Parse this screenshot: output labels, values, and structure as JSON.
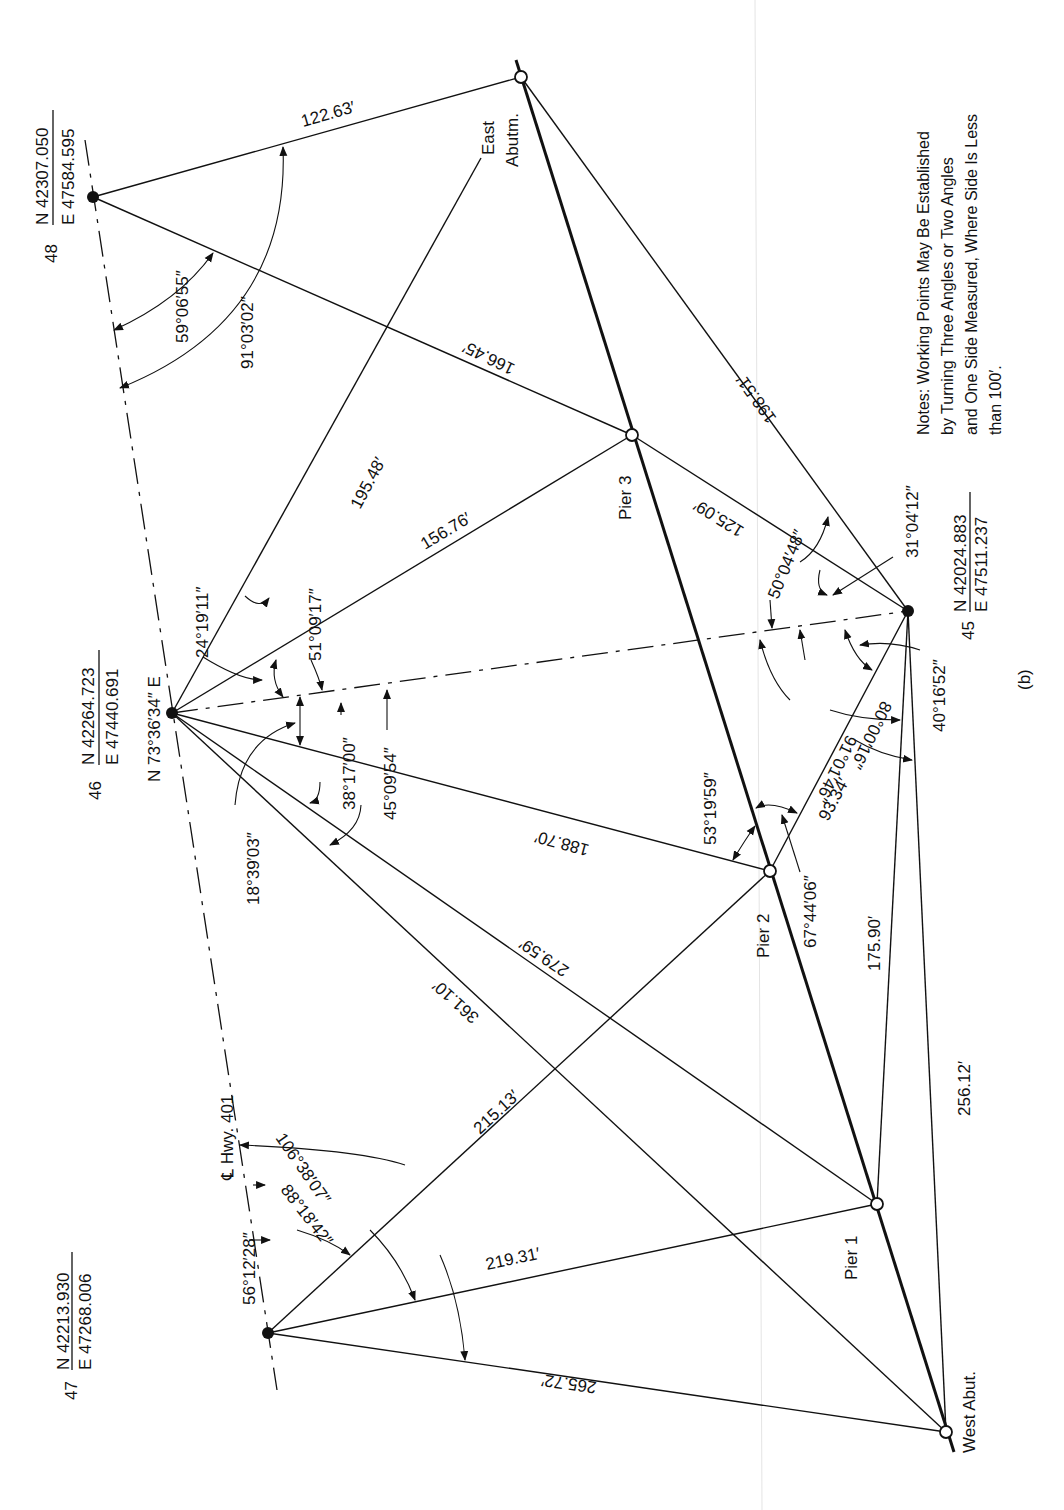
{
  "figure": {
    "label": "(b)",
    "note_lines": [
      "Notes:  Working Points May Be Established",
      "by Turning Three Angles or Two Angles",
      "and One Side Measured, Where Side Is Less",
      "than 100′."
    ]
  },
  "highway": {
    "label": "℄ Hwy. 401",
    "bearing": "N 73°36′34″ E"
  },
  "stations": [
    {
      "id": "48",
      "northing": "N 42307.050",
      "easting": "E 47584.595"
    },
    {
      "id": "46",
      "northing": "N 42264.723",
      "easting": "E 47440.691"
    },
    {
      "id": "47",
      "northing": "N 42213.930",
      "easting": "E 47268.006"
    },
    {
      "id": "45",
      "northing": "N 42024.883",
      "easting": "E 47511.237"
    }
  ],
  "working_points": [
    {
      "name": "East Abutm.",
      "line1": "East",
      "line2": "Abutm."
    },
    {
      "name": "Pier 3"
    },
    {
      "name": "Pier 2"
    },
    {
      "name": "Pier 1"
    },
    {
      "name": "West Abut."
    }
  ],
  "distances": {
    "s48_east_abut": "122.63′",
    "s48_pier3": "166.45′",
    "s46_east_abut": "195.48′",
    "s46_pier3": "156.76′",
    "s46_pier2": "188.70′",
    "s46_pier1": "279.59′",
    "s46_west_abut": "361.10′",
    "s47_pier2": "215.13′",
    "s47_pier1": "219.31′",
    "s47_west_abut": "265.72′",
    "s45_east_abut": "198.51′",
    "s45_pier3": "125.09′",
    "s45_pier2": "93.34′",
    "s45_pier1": "175.90′",
    "s45_west_abut": "256.12′"
  },
  "angles": {
    "s48_a1": "59°06′55″",
    "s48_a2": "91°03′02″",
    "s46_a1": "24°19′11″",
    "s46_a2": "51°09′17″",
    "s46_a3": "18°39′03″",
    "s46_a4": "38°17′00″",
    "s46_a5": "45°09′54″",
    "s47_a1": "56°12′28″",
    "s47_a2": "88°18′42″",
    "s47_a3": "106°38′07″",
    "s45_a1": "31°04′12″",
    "s45_a2": "50°04′48″",
    "s45_a3": "40°16′52″",
    "s45_a4": "80°00′16″",
    "s45_a5": "91°01′46″",
    "pier2_a1": "53°19′59″",
    "pier2_a2": "67°44′06″"
  }
}
